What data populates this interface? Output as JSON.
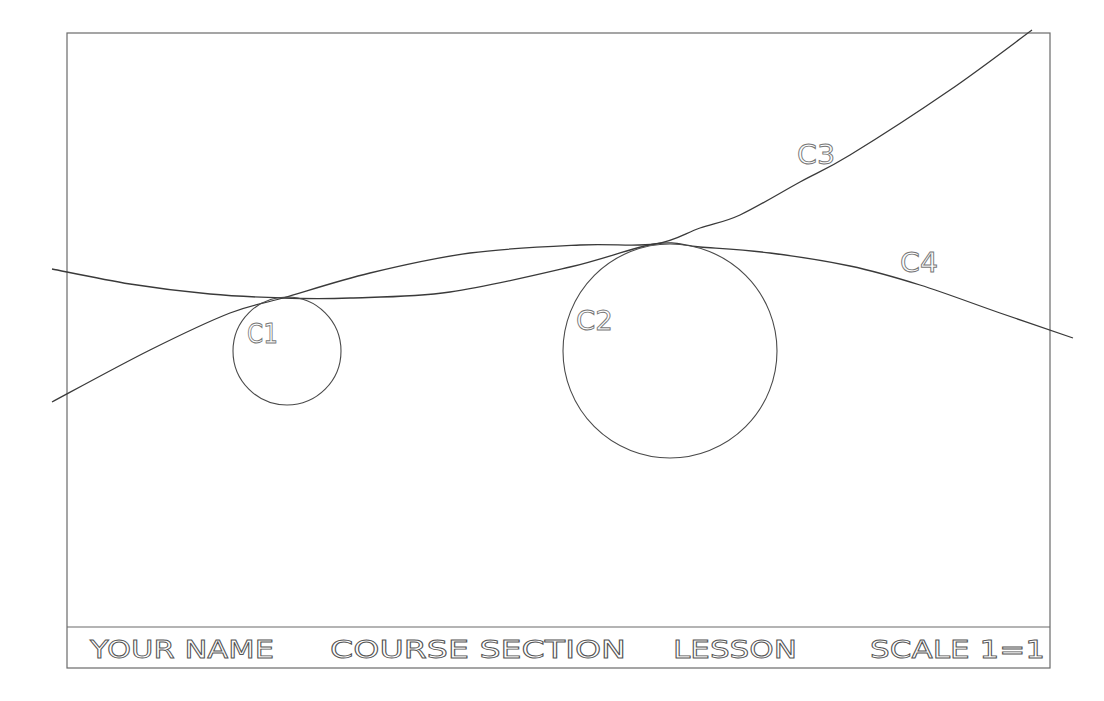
{
  "drawing": {
    "frame": {
      "x": 67,
      "y": 33,
      "width": 983,
      "height": 635
    },
    "colors": {
      "background": "#ffffff",
      "line": "#3a3a3a",
      "frame": "#6a6a6a",
      "text": "#666666"
    },
    "circles": [
      {
        "id": "C1",
        "label": "C1",
        "cx": 287,
        "cy": 351,
        "r": 54,
        "label_x": 247,
        "label_y": 343
      },
      {
        "id": "C2",
        "label": "C2",
        "cx": 670,
        "cy": 351,
        "r": 107,
        "label_x": 576,
        "label_y": 330
      }
    ],
    "curves": [
      {
        "id": "C3",
        "label": "C3",
        "label_x": 797,
        "label_y": 164,
        "points": [
          [
            52,
            402
          ],
          [
            150,
            350
          ],
          [
            230,
            313
          ],
          [
            283,
            298
          ],
          [
            370,
            273
          ],
          [
            470,
            253
          ],
          [
            580,
            245
          ],
          [
            655,
            244
          ],
          [
            700,
            228
          ],
          [
            740,
            215
          ],
          [
            800,
            182
          ],
          [
            850,
            155
          ],
          [
            950,
            90
          ],
          [
            1032,
            30
          ]
        ]
      },
      {
        "id": "C4",
        "label": "C4",
        "label_x": 900,
        "label_y": 272,
        "points": [
          [
            52,
            269
          ],
          [
            130,
            284
          ],
          [
            210,
            294
          ],
          [
            283,
            298
          ],
          [
            350,
            298
          ],
          [
            450,
            292
          ],
          [
            570,
            267
          ],
          [
            655,
            244
          ],
          [
            700,
            247
          ],
          [
            770,
            253
          ],
          [
            850,
            266
          ],
          [
            920,
            285
          ],
          [
            1000,
            313
          ],
          [
            1073,
            338
          ]
        ]
      }
    ]
  },
  "title_block": {
    "your_name": "YOUR NAME",
    "course_section": "COURSE SECTION",
    "lesson": "LESSON",
    "scale": "SCALE 1=1"
  }
}
